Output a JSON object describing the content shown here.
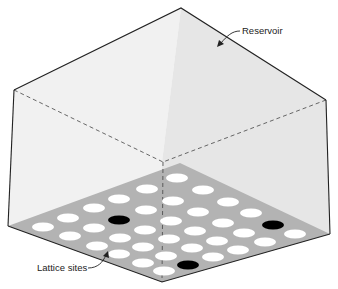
{
  "figure": {
    "labels": {
      "reservoir": "Reservoir",
      "lattice_sites": "Lattice sites"
    },
    "colors": {
      "left_wall": "#f1f1f1",
      "right_wall": "#e6e6e6",
      "floor": "#b3b3b3",
      "empty_site": "#ffffff",
      "occupied_site": "#000000",
      "edge": "#222222"
    },
    "lattice": {
      "empty_sites": [
        [
          177,
          178
        ],
        [
          147,
          189
        ],
        [
          203,
          190
        ],
        [
          119,
          199
        ],
        [
          173,
          201
        ],
        [
          228,
          202
        ],
        [
          94,
          208
        ],
        [
          146,
          210
        ],
        [
          198,
          212
        ],
        [
          251,
          213
        ],
        [
          68,
          218
        ],
        [
          171,
          221
        ],
        [
          223,
          223
        ],
        [
          43,
          227
        ],
        [
          94,
          228
        ],
        [
          145,
          230
        ],
        [
          195,
          231
        ],
        [
          244,
          233
        ],
        [
          295,
          234
        ],
        [
          70,
          236
        ],
        [
          120,
          238
        ],
        [
          169,
          239
        ],
        [
          217,
          241
        ],
        [
          265,
          242
        ],
        [
          97,
          246
        ],
        [
          143,
          247
        ],
        [
          192,
          248
        ],
        [
          238,
          250
        ],
        [
          119,
          254
        ],
        [
          166,
          256
        ],
        [
          213,
          257
        ],
        [
          143,
          263
        ],
        [
          164,
          271
        ]
      ],
      "occupied_sites": [
        [
          119,
          220
        ],
        [
          273,
          225
        ],
        [
          188,
          265
        ]
      ]
    }
  }
}
